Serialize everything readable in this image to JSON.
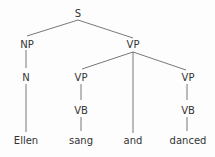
{
  "tree": {
    "nodes": {
      "s": "S",
      "np": "NP",
      "vp": "VP",
      "n": "N",
      "vp1": "VP",
      "vp2": "VP",
      "vb1": "VB",
      "vb2": "VB",
      "ellen": "Ellen",
      "sang": "sang",
      "and": "and",
      "danced": "danced"
    },
    "edges": [
      [
        "S",
        "NP"
      ],
      [
        "S",
        "VP"
      ],
      [
        "NP",
        "N"
      ],
      [
        "N",
        "Ellen"
      ],
      [
        "VP",
        "VP"
      ],
      [
        "VP",
        "and"
      ],
      [
        "VP",
        "VP"
      ],
      [
        "VP",
        "VB"
      ],
      [
        "VB",
        "sang"
      ],
      [
        "VP",
        "VB"
      ],
      [
        "VB",
        "danced"
      ]
    ]
  }
}
